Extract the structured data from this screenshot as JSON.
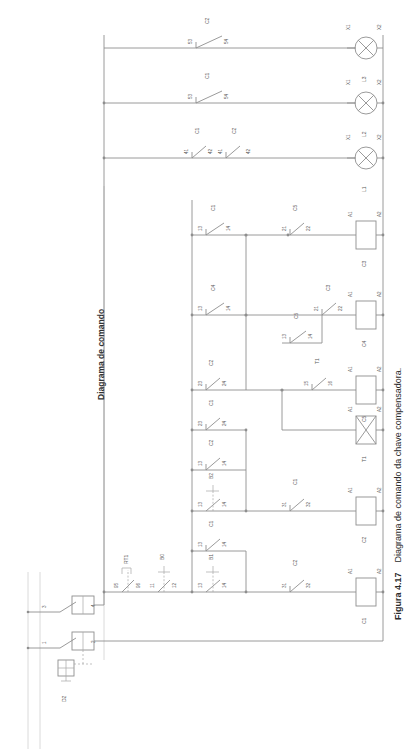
{
  "figure": {
    "number": "Figura 4.17",
    "caption": "Diagrama de comando da chave compensadora.",
    "full_caption": "Figura 4.17   Diagrama de comando da chave compensadora."
  },
  "diagram": {
    "title": "Diagrama de comando",
    "type": "ladder-control-diagram",
    "language": "pt-BR",
    "orientation": "rotated-90-ccw"
  },
  "supply": {
    "device_label": "D2",
    "switch_terminals": [
      "1",
      "2",
      "3",
      "4"
    ],
    "notes": "seccionadora fusivel com transformador de comando"
  },
  "protection_row": {
    "devices": [
      {
        "name": "RT1",
        "terminals": [
          "95",
          "96"
        ],
        "type": "overload-relay-nc"
      },
      {
        "name": "B0",
        "terminals": [
          "11",
          "12"
        ],
        "type": "pushbutton-nc"
      }
    ]
  },
  "rungs": [
    {
      "id": "rung-c1",
      "elements": [
        {
          "name": "B1",
          "terminals": [
            "13",
            "14"
          ],
          "type": "pushbutton-no"
        },
        {
          "name": "C2",
          "terminals": [
            "31",
            "32"
          ],
          "type": "contact-nc"
        }
      ],
      "coil": {
        "name": "C1",
        "terminals": [
          "A1",
          "A2"
        ],
        "type": "contactor-coil"
      }
    },
    {
      "id": "rung-seal-c1",
      "elements": [
        {
          "name": "C1",
          "terminals": [
            "13",
            "14"
          ],
          "type": "contact-no"
        }
      ],
      "coil": null
    },
    {
      "id": "rung-c2",
      "elements": [
        {
          "name": "B2",
          "terminals": [
            "13",
            "14"
          ],
          "type": "pushbutton-no"
        },
        {
          "name": "C1",
          "terminals": [
            "31",
            "32"
          ],
          "type": "contact-nc"
        }
      ],
      "coil": {
        "name": "C2",
        "terminals": [
          "A1",
          "A2"
        ],
        "type": "contactor-coil"
      }
    },
    {
      "id": "rung-t1",
      "elements": [
        {
          "name": "C2",
          "terminals": [
            "13",
            "14"
          ],
          "type": "contact-no"
        }
      ],
      "coil": {
        "name": "T1",
        "terminals": [
          "A1",
          "A2"
        ],
        "type": "timer-coil"
      }
    },
    {
      "id": "rung-c5",
      "elements": [
        {
          "name": "C1",
          "terminals": [
            "23",
            "24"
          ],
          "type": "contact-no"
        },
        {
          "name": "C2",
          "terminals": [
            "23",
            "24"
          ],
          "type": "contact-no"
        },
        {
          "name": "T1",
          "terminals": [
            "15",
            "16"
          ],
          "type": "timer-contact-nc"
        }
      ],
      "coil": {
        "name": "C5",
        "terminals": [
          "A1",
          "A2"
        ],
        "type": "contactor-coil"
      }
    },
    {
      "id": "rung-c4",
      "elements": [
        {
          "name": "C4",
          "terminals": [
            "13",
            "14"
          ],
          "type": "contact-no"
        },
        {
          "name": "C5",
          "terminals": [
            "13",
            "14"
          ],
          "type": "contact-no"
        },
        {
          "name": "C3",
          "terminals": [
            "21",
            "22"
          ],
          "type": "contact-nc"
        }
      ],
      "coil": {
        "name": "C4",
        "terminals": [
          "A1",
          "A2"
        ],
        "type": "contactor-coil"
      }
    },
    {
      "id": "rung-c3",
      "elements": [
        {
          "name": "C1",
          "terminals": [
            "13",
            "14"
          ],
          "type": "contact-no"
        },
        {
          "name": "C5",
          "terminals": [
            "21",
            "22"
          ],
          "type": "contact-nc"
        }
      ],
      "coil": {
        "name": "C3",
        "terminals": [
          "A1",
          "A2"
        ],
        "type": "contactor-coil"
      }
    }
  ],
  "signal_lamps": [
    {
      "id": "lamp-l1",
      "label": "L1",
      "terminals": [
        "X1",
        "X2"
      ],
      "series_contacts": [
        {
          "name": "C1",
          "terminals": [
            "41",
            "42"
          ],
          "type": "contact-nc"
        },
        {
          "name": "C2",
          "terminals": [
            "41",
            "42"
          ],
          "type": "contact-nc"
        }
      ]
    },
    {
      "id": "lamp-l2",
      "label": "L2",
      "terminals": [
        "X1",
        "X2"
      ],
      "series_contacts": [
        {
          "name": "C1",
          "terminals": [
            "53",
            "54"
          ],
          "type": "contact-no"
        }
      ]
    },
    {
      "id": "lamp-l3",
      "label": "L3",
      "terminals": [
        "X1",
        "X2"
      ],
      "series_contacts": [
        {
          "name": "C2",
          "terminals": [
            "53",
            "54"
          ],
          "type": "contact-no"
        }
      ]
    }
  ],
  "colors": {
    "wire": "#8e8e8e",
    "label": "#5a5a5a",
    "caption": "#2b2b2b",
    "background": "#ffffff"
  }
}
